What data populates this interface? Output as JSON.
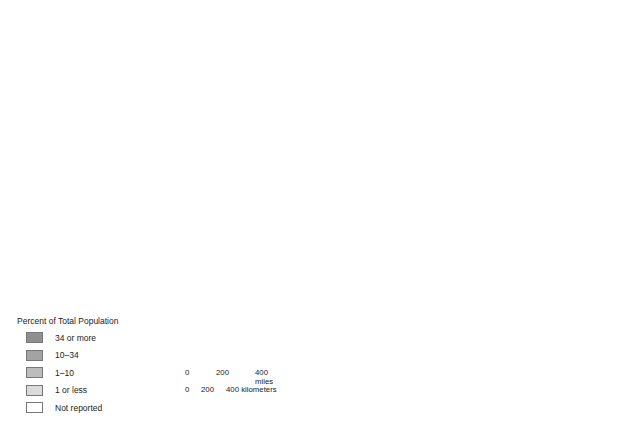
{
  "map": {
    "countries": [
      "CANADA",
      "MEXICO"
    ],
    "water_bodies": [
      "PACIFIC OCEAN",
      "ATLANTIC OCEAN",
      "Gulf of Mexico"
    ],
    "states": [
      {
        "label": "WASHINGTON",
        "shade": "mixed"
      },
      {
        "label": "OREGON",
        "shade": "mixed"
      },
      {
        "label": "IDAHO",
        "shade": "mixed"
      },
      {
        "label": "MONTANA",
        "shade": "mixed"
      },
      {
        "label": "WYOMING",
        "shade": "mixed"
      },
      {
        "label": "NORTH DAKOTA",
        "shade": "mixed"
      },
      {
        "label": "SOUTH DAKOTA",
        "shade": "mixed"
      },
      {
        "label": "NEBRASKA",
        "shade": "mixed"
      },
      {
        "label": "NEVADA",
        "shade": "mixed"
      },
      {
        "label": "UTAH",
        "shade": "mixed"
      },
      {
        "label": "COLORADO",
        "shade": "mixed"
      },
      {
        "label": "KANSAS",
        "shade": "mixed"
      },
      {
        "label": "CALIFORNIA",
        "shade": "mixed"
      },
      {
        "label": "ARIZONA",
        "shade": "mixed"
      },
      {
        "label": "NEW MEXICO",
        "shade": "mixed"
      },
      {
        "label": "OKLAHOMA",
        "shade": "not-reported"
      },
      {
        "label": "TEXAS",
        "shade": "mixed"
      },
      {
        "label": "MINN.",
        "shade": "mixed"
      },
      {
        "label": "WIS.",
        "shade": "mixed"
      },
      {
        "label": "IOWA",
        "shade": "mixed"
      },
      {
        "label": "MICH.",
        "shade": "mixed"
      },
      {
        "label": "ILL.",
        "shade": "mixed"
      },
      {
        "label": "IND.",
        "shade": "mixed"
      },
      {
        "label": "OHIO",
        "shade": "mixed"
      },
      {
        "label": "MISSOURI",
        "shade": "mixed"
      },
      {
        "label": "KY.",
        "shade": "mixed"
      },
      {
        "label": "W. VA.",
        "shade": "mixed"
      },
      {
        "label": "VA.",
        "shade": "mixed"
      },
      {
        "label": "PENN.",
        "shade": "mixed"
      },
      {
        "label": "NEW YORK",
        "shade": "mixed"
      },
      {
        "label": "VT.",
        "shade": "mixed"
      },
      {
        "label": "N.H.",
        "shade": "mixed"
      },
      {
        "label": "MAINE",
        "shade": "mixed"
      },
      {
        "label": "MASS.",
        "shade": "mixed"
      },
      {
        "label": "R.I.",
        "shade": "mixed"
      },
      {
        "label": "CONN.",
        "shade": "mixed"
      },
      {
        "label": "N.J.",
        "shade": "mixed"
      },
      {
        "label": "DEL.",
        "shade": "mixed"
      },
      {
        "label": "MD.",
        "shade": "mixed"
      },
      {
        "label": "TENN.",
        "shade": "mixed"
      },
      {
        "label": "N.C.",
        "shade": "mixed"
      },
      {
        "label": "S.C.",
        "shade": "mixed"
      },
      {
        "label": "ARK.",
        "shade": "mixed"
      },
      {
        "label": "LA.",
        "shade": "mixed"
      },
      {
        "label": "MISS.",
        "shade": "mixed"
      },
      {
        "label": "ALA.",
        "shade": "mixed"
      },
      {
        "label": "GEORGIA",
        "shade": "mixed"
      },
      {
        "label": "FLORIDA",
        "shade": "mixed"
      }
    ]
  },
  "legend": {
    "title": "Percent of Total Population",
    "items": [
      {
        "label": "34 or more",
        "color": "#8f8f8f"
      },
      {
        "label": "10–34",
        "color": "#a3a3a3"
      },
      {
        "label": "1–10",
        "color": "#bcbcbc"
      },
      {
        "label": "1 or less",
        "color": "#dadada"
      },
      {
        "label": "Not reported",
        "color": "#ffffff"
      }
    ]
  },
  "scale": {
    "miles_ticks": [
      "0",
      "200",
      "400 miles"
    ],
    "km_ticks": [
      "0",
      "200",
      "400 kilometers"
    ]
  }
}
